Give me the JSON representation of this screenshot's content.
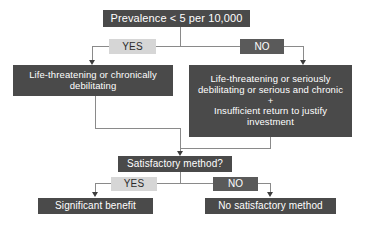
{
  "diagram": {
    "type": "flowchart",
    "colors": {
      "node_dark_bg": "#4a4a4a",
      "node_dark_text": "#ffffff",
      "label_yes_bg": "#d6d6d6",
      "label_yes_text": "#2b2b2b",
      "label_no_bg": "#5a5a5a",
      "label_no_text": "#ffffff",
      "connector": "#8a8a8a",
      "arrowhead": "#3d3d3d",
      "background": "#ffffff"
    },
    "nodes": {
      "root": {
        "id": "prevalence",
        "text": "Prevalence < 5 per 10,000",
        "style": "dark"
      },
      "branch_yes_top": {
        "id": "yes-top",
        "text": "YES",
        "style": "light"
      },
      "branch_no_top": {
        "id": "no-top",
        "text": "NO",
        "style": "no"
      },
      "left_criteria": {
        "id": "left-criteria",
        "lines": [
          "Life-threatening or chronically",
          "debilitating"
        ],
        "style": "dark"
      },
      "right_criteria": {
        "id": "right-criteria",
        "lines": [
          "Life-threatening or seriously",
          "debilitating or serious and chronic",
          "+",
          "Insufficient return to justify",
          "investment"
        ],
        "style": "dark"
      },
      "satisfactory": {
        "id": "satisfactory-method",
        "text": "Satisfactory method?",
        "style": "dark"
      },
      "branch_yes_bottom": {
        "id": "yes-bottom",
        "text": "YES",
        "style": "light"
      },
      "branch_no_bottom": {
        "id": "no-bottom",
        "text": "NO",
        "style": "no"
      },
      "outcome_left": {
        "id": "significant-benefit",
        "text": "Significant benefit",
        "style": "dark"
      },
      "outcome_right": {
        "id": "no-satisfactory-method",
        "text": "No satisfactory method",
        "style": "dark"
      }
    }
  }
}
